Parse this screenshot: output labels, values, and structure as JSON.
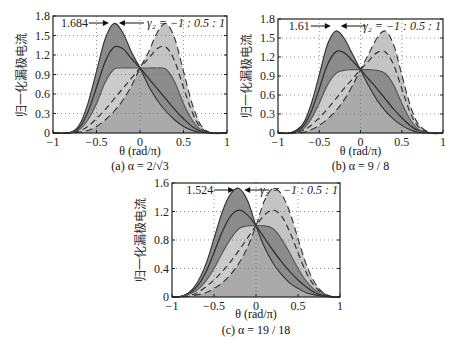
{
  "chart_data": [
    {
      "type": "line",
      "panel": "a",
      "caption": "(a) α = 2/√3",
      "xlabel": "θ (rad/π)",
      "ylabel": "归一化漏极电流",
      "xlim": [
        -1,
        1
      ],
      "ylim": [
        0,
        1.8
      ],
      "xticks": [
        "-1",
        "-0.5",
        "0",
        "0.5",
        "1"
      ],
      "yticks": [
        "0",
        "0.3",
        "0.6",
        "0.9",
        "1.2",
        "1.5",
        "1.8"
      ],
      "ytick_values": [
        0,
        0.3,
        0.6,
        0.9,
        1.2,
        1.5,
        1.8
      ],
      "grid": true,
      "annotation_peak": "1.684",
      "annotation_param": "γ₂ = −1 : 0.5 : 1",
      "x": [
        -0.82,
        -0.7,
        -0.6,
        -0.5,
        -0.4,
        -0.3,
        -0.2,
        -0.1,
        0,
        0.1,
        0.2,
        0.3,
        0.4,
        0.5,
        0.6,
        0.7,
        0.82
      ],
      "series": [
        {
          "name": "γ2=-1",
          "values": [
            0,
            0.12,
            0.45,
            0.95,
            1.45,
            1.684,
            1.55,
            1.25,
            1.0,
            0.72,
            0.5,
            0.33,
            0.2,
            0.1,
            0.04,
            0.01,
            0
          ]
        },
        {
          "name": "γ2=-0.5",
          "values": [
            0,
            0.08,
            0.32,
            0.7,
            1.1,
            1.32,
            1.3,
            1.15,
            1.0,
            0.84,
            0.68,
            0.52,
            0.36,
            0.22,
            0.1,
            0.03,
            0
          ]
        },
        {
          "name": "γ2=0",
          "values": [
            0,
            0.05,
            0.2,
            0.45,
            0.78,
            0.98,
            1.0,
            1.0,
            1.0,
            1.0,
            1.0,
            0.98,
            0.78,
            0.45,
            0.2,
            0.05,
            0
          ]
        },
        {
          "name": "γ2=0.5",
          "values": [
            0,
            0.03,
            0.1,
            0.22,
            0.36,
            0.52,
            0.68,
            0.84,
            1.0,
            1.15,
            1.3,
            1.32,
            1.1,
            0.7,
            0.32,
            0.08,
            0
          ]
        },
        {
          "name": "γ2=1",
          "values": [
            0,
            0.01,
            0.04,
            0.1,
            0.2,
            0.33,
            0.5,
            0.72,
            1.0,
            1.25,
            1.55,
            1.684,
            1.45,
            0.95,
            0.45,
            0.12,
            0
          ]
        }
      ]
    },
    {
      "type": "line",
      "panel": "b",
      "caption": "(b) α = 9 / 8",
      "xlabel": "θ (rad/π)",
      "ylabel": "归一化漏极电流",
      "xlim": [
        -1,
        1
      ],
      "ylim": [
        0,
        1.8
      ],
      "xticks": [
        "-1",
        "-0.5",
        "0",
        "0.5",
        "1"
      ],
      "yticks": [
        "0",
        "0.3",
        "0.6",
        "0.9",
        "1.2",
        "1.5",
        "1.8"
      ],
      "ytick_values": [
        0,
        0.3,
        0.6,
        0.9,
        1.2,
        1.5,
        1.8
      ],
      "grid": true,
      "annotation_peak": "1.61",
      "annotation_param": "γ₂ = −1 : 0.5 : 1",
      "x": [
        -0.85,
        -0.7,
        -0.6,
        -0.5,
        -0.4,
        -0.3,
        -0.2,
        -0.1,
        0,
        0.1,
        0.2,
        0.3,
        0.4,
        0.5,
        0.6,
        0.7,
        0.85
      ],
      "series": [
        {
          "name": "γ2=-1",
          "values": [
            0,
            0.14,
            0.45,
            0.92,
            1.4,
            1.61,
            1.5,
            1.25,
            1.0,
            0.74,
            0.52,
            0.35,
            0.22,
            0.12,
            0.05,
            0.01,
            0
          ]
        },
        {
          "name": "γ2=-0.5",
          "values": [
            0,
            0.1,
            0.33,
            0.7,
            1.08,
            1.28,
            1.27,
            1.14,
            1.0,
            0.85,
            0.7,
            0.54,
            0.38,
            0.24,
            0.12,
            0.04,
            0
          ]
        },
        {
          "name": "γ2=0",
          "values": [
            0,
            0.06,
            0.22,
            0.47,
            0.76,
            0.94,
            0.99,
            1.0,
            1.0,
            1.0,
            0.99,
            0.94,
            0.76,
            0.47,
            0.22,
            0.06,
            0
          ]
        },
        {
          "name": "γ2=0.5",
          "values": [
            0,
            0.04,
            0.12,
            0.24,
            0.38,
            0.54,
            0.7,
            0.85,
            1.0,
            1.14,
            1.27,
            1.28,
            1.08,
            0.7,
            0.33,
            0.1,
            0
          ]
        },
        {
          "name": "γ2=1",
          "values": [
            0,
            0.01,
            0.05,
            0.12,
            0.22,
            0.35,
            0.52,
            0.74,
            1.0,
            1.25,
            1.5,
            1.61,
            1.4,
            0.92,
            0.45,
            0.14,
            0
          ]
        }
      ]
    },
    {
      "type": "line",
      "panel": "c",
      "caption": "(c) α = 19 / 18",
      "xlabel": "θ (rad/π)",
      "ylabel": "归一化漏极电流",
      "xlim": [
        -1,
        1
      ],
      "ylim": [
        0,
        1.6
      ],
      "xticks": [
        "-1",
        "-0.5",
        "0",
        "0.5",
        "1"
      ],
      "yticks": [
        "0",
        "0.4",
        "0.8",
        "1.2",
        "1.6"
      ],
      "ytick_values": [
        0,
        0.4,
        0.8,
        1.2,
        1.6
      ],
      "grid": true,
      "annotation_peak": "1.524",
      "annotation_param": "γ₂ = −1 : 0.5 : 1",
      "x": [
        -0.92,
        -0.8,
        -0.7,
        -0.6,
        -0.5,
        -0.4,
        -0.3,
        -0.2,
        -0.1,
        0,
        0.1,
        0.2,
        0.3,
        0.4,
        0.5,
        0.6,
        0.7,
        0.8,
        0.92
      ],
      "series": [
        {
          "name": "γ2=-1",
          "values": [
            0,
            0.06,
            0.2,
            0.45,
            0.82,
            1.2,
            1.45,
            1.524,
            1.35,
            1.0,
            0.7,
            0.48,
            0.32,
            0.2,
            0.12,
            0.06,
            0.03,
            0.01,
            0
          ]
        },
        {
          "name": "γ2=-0.5",
          "values": [
            0,
            0.05,
            0.15,
            0.34,
            0.62,
            0.92,
            1.14,
            1.22,
            1.15,
            1.0,
            0.83,
            0.66,
            0.5,
            0.36,
            0.24,
            0.14,
            0.06,
            0.02,
            0
          ]
        },
        {
          "name": "γ2=0",
          "values": [
            0,
            0.04,
            0.1,
            0.22,
            0.4,
            0.62,
            0.82,
            0.96,
            1.0,
            1.0,
            1.0,
            0.96,
            0.82,
            0.62,
            0.4,
            0.22,
            0.1,
            0.04,
            0
          ]
        },
        {
          "name": "γ2=0.5",
          "values": [
            0,
            0.02,
            0.06,
            0.14,
            0.24,
            0.36,
            0.5,
            0.66,
            0.83,
            1.0,
            1.15,
            1.22,
            1.14,
            0.92,
            0.62,
            0.34,
            0.15,
            0.05,
            0
          ]
        },
        {
          "name": "γ2=1",
          "values": [
            0,
            0.01,
            0.03,
            0.06,
            0.12,
            0.2,
            0.32,
            0.48,
            0.7,
            1.0,
            1.35,
            1.524,
            1.45,
            1.2,
            0.82,
            0.45,
            0.2,
            0.06,
            0
          ]
        }
      ]
    }
  ],
  "layout": {
    "panels": [
      {
        "left": 53,
        "top": 16,
        "right": 227,
        "bottom": 133,
        "caption_y": 170,
        "xlabel_y": 155
      },
      {
        "left": 278,
        "top": 19,
        "right": 443,
        "bottom": 133,
        "caption_y": 170,
        "xlabel_y": 155
      },
      {
        "left": 172,
        "top": 183,
        "right": 340,
        "bottom": 297,
        "caption_y": 334,
        "xlabel_y": 318
      }
    ]
  },
  "colors": {
    "dark_fill": "#8c8c8c",
    "light_fill": "#c4c4c4",
    "curve": "#333333",
    "mid_curve": "#5a5a5a",
    "grid": "#777777"
  }
}
